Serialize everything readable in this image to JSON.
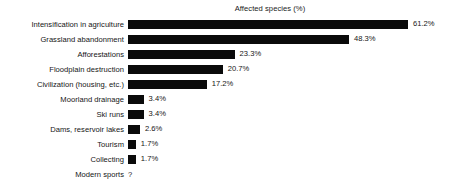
{
  "chart_data": {
    "type": "bar",
    "orientation": "horizontal",
    "title": "Affected species (%)",
    "xlabel": "",
    "ylabel": "",
    "xlim": [
      0,
      61.2
    ],
    "grid": false,
    "legend": null,
    "unknown_symbol": "?",
    "categories": [
      "Intensification in agriculture",
      "Grassland abandonment",
      "Afforestations",
      "Floodplain destruction",
      "Civilization (housing, etc.)",
      "Moorland drainage",
      "Ski runs",
      "Dams, reservoir lakes",
      "Tourism",
      "Collecting",
      "Modern sports"
    ],
    "values": [
      61.2,
      48.3,
      23.3,
      20.7,
      17.2,
      3.4,
      3.4,
      2.6,
      1.7,
      1.7,
      null
    ],
    "value_labels": [
      "61.2%",
      "48.3%",
      "23.3%",
      "20.7%",
      "17.2%",
      "3.4%",
      "3.4%",
      "2.6%",
      "1.7%",
      "1.7%",
      "?"
    ],
    "bar_color": "#0a0a0a",
    "background_color": "#ffffff"
  }
}
